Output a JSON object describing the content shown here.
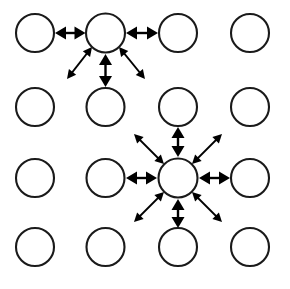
{
  "figure": {
    "name": "grid-neighborhood-interaction-diagram",
    "width": 290,
    "height": 289,
    "background_color": "#ffffff"
  },
  "style": {
    "node_stroke_color": "#1a1a1a",
    "node_fill_color": "#ffffff",
    "node_stroke_width": 2.1,
    "node_radius": 19,
    "arrow_color": "#000000",
    "arrow_shaft_width": 2.4,
    "arrow_head_length": 11,
    "arrow_head_half_width": 6.5,
    "diagonal_arrow_head_length": 9,
    "diagonal_arrow_head_half_width": 4.6
  },
  "grid": {
    "columns": 4,
    "rows": 4,
    "column_centers_x": [
      35,
      105.5,
      178,
      250
    ],
    "row_centers_y": [
      33,
      107,
      178,
      247
    ],
    "nodes": [
      {
        "id": "r1c1",
        "row": 1,
        "col": 1,
        "cx": 35,
        "cy": 33,
        "r": 19,
        "role": "plain"
      },
      {
        "id": "r1c2",
        "row": 1,
        "col": 2,
        "cx": 105.5,
        "cy": 33,
        "r": 19.5,
        "role": "hub"
      },
      {
        "id": "r1c3",
        "row": 1,
        "col": 3,
        "cx": 178,
        "cy": 33,
        "r": 19,
        "role": "plain"
      },
      {
        "id": "r1c4",
        "row": 1,
        "col": 4,
        "cx": 250,
        "cy": 33,
        "r": 19,
        "role": "plain"
      },
      {
        "id": "r2c1",
        "row": 2,
        "col": 1,
        "cx": 35,
        "cy": 107,
        "r": 19,
        "role": "plain"
      },
      {
        "id": "r2c2",
        "row": 2,
        "col": 2,
        "cx": 105.5,
        "cy": 107,
        "r": 19,
        "role": "plain"
      },
      {
        "id": "r2c3",
        "row": 2,
        "col": 3,
        "cx": 178,
        "cy": 107,
        "r": 19,
        "role": "plain"
      },
      {
        "id": "r2c4",
        "row": 2,
        "col": 4,
        "cx": 250,
        "cy": 107,
        "r": 19,
        "role": "plain"
      },
      {
        "id": "r3c1",
        "row": 3,
        "col": 1,
        "cx": 35,
        "cy": 178,
        "r": 19,
        "role": "plain"
      },
      {
        "id": "r3c2",
        "row": 3,
        "col": 2,
        "cx": 105.5,
        "cy": 178,
        "r": 19,
        "role": "plain"
      },
      {
        "id": "r3c3",
        "row": 3,
        "col": 3,
        "cx": 178,
        "cy": 178,
        "r": 19.5,
        "role": "hub"
      },
      {
        "id": "r3c4",
        "row": 3,
        "col": 4,
        "cx": 250,
        "cy": 178,
        "r": 19,
        "role": "plain"
      },
      {
        "id": "r4c1",
        "row": 4,
        "col": 1,
        "cx": 35,
        "cy": 247,
        "r": 19,
        "role": "plain"
      },
      {
        "id": "r4c2",
        "row": 4,
        "col": 2,
        "cx": 105.5,
        "cy": 247,
        "r": 19,
        "role": "plain"
      },
      {
        "id": "r4c3",
        "row": 4,
        "col": 3,
        "cx": 178,
        "cy": 247,
        "r": 19,
        "role": "plain"
      },
      {
        "id": "r4c4",
        "row": 4,
        "col": 4,
        "cx": 250,
        "cy": 247,
        "r": 19,
        "role": "plain"
      }
    ]
  },
  "hubs": [
    {
      "id": "hub-top",
      "node": "r1c2",
      "cx": 105.5,
      "cy": 33,
      "arrow_count": 5,
      "directions": [
        "left",
        "right",
        "down-left",
        "down",
        "down-right"
      ]
    },
    {
      "id": "hub-bottom",
      "node": "r3c3",
      "cx": 178,
      "cy": 178,
      "arrow_count": 8,
      "directions": [
        "up-left",
        "up",
        "up-right",
        "left",
        "right",
        "down-left",
        "down",
        "down-right"
      ]
    }
  ],
  "arrows": [
    {
      "id": "top-left",
      "hub": "hub-top",
      "direction": "left",
      "kind": "orthogonal",
      "x1": 85.5,
      "y1": 33,
      "x2": 55,
      "y2": 33
    },
    {
      "id": "top-right",
      "hub": "hub-top",
      "direction": "right",
      "kind": "orthogonal",
      "x1": 126,
      "y1": 33,
      "x2": 158,
      "y2": 33
    },
    {
      "id": "top-down",
      "hub": "hub-top",
      "direction": "down",
      "kind": "orthogonal",
      "x1": 105.5,
      "y1": 54,
      "x2": 105.5,
      "y2": 87
    },
    {
      "id": "top-down-left",
      "hub": "hub-top",
      "direction": "down-left",
      "kind": "diagonal",
      "x1": 92,
      "y1": 47,
      "x2": 67,
      "y2": 79
    },
    {
      "id": "top-down-right",
      "hub": "hub-top",
      "direction": "down-right",
      "kind": "diagonal",
      "x1": 119,
      "y1": 47,
      "x2": 145,
      "y2": 79
    },
    {
      "id": "bot-left",
      "hub": "hub-bottom",
      "direction": "left",
      "kind": "orthogonal",
      "x1": 157,
      "y1": 178,
      "x2": 126,
      "y2": 178
    },
    {
      "id": "bot-right",
      "hub": "hub-bottom",
      "direction": "right",
      "kind": "orthogonal",
      "x1": 199,
      "y1": 178,
      "x2": 230,
      "y2": 178
    },
    {
      "id": "bot-up",
      "hub": "hub-bottom",
      "direction": "up",
      "kind": "orthogonal",
      "x1": 178,
      "y1": 157,
      "x2": 178,
      "y2": 127
    },
    {
      "id": "bot-down",
      "hub": "hub-bottom",
      "direction": "down",
      "kind": "orthogonal",
      "x1": 178,
      "y1": 199,
      "x2": 178,
      "y2": 228
    },
    {
      "id": "bot-up-left",
      "hub": "hub-bottom",
      "direction": "up-left",
      "kind": "diagonal",
      "x1": 164,
      "y1": 164,
      "x2": 134,
      "y2": 134
    },
    {
      "id": "bot-up-right",
      "hub": "hub-bottom",
      "direction": "up-right",
      "kind": "diagonal",
      "x1": 192,
      "y1": 164,
      "x2": 222,
      "y2": 134
    },
    {
      "id": "bot-down-left",
      "hub": "hub-bottom",
      "direction": "down-left",
      "kind": "diagonal",
      "x1": 164,
      "y1": 192,
      "x2": 134,
      "y2": 222
    },
    {
      "id": "bot-down-right",
      "hub": "hub-bottom",
      "direction": "down-right",
      "kind": "diagonal",
      "x1": 192,
      "y1": 192,
      "x2": 222,
      "y2": 222
    }
  ]
}
